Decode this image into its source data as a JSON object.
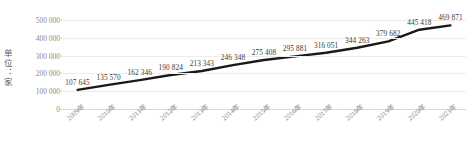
{
  "chart_data": {
    "type": "line",
    "title": "",
    "subtitle": "",
    "xlabel": "",
    "ylabel": "单位：家",
    "categories": [
      "2009年",
      "2010年",
      "2011年",
      "2012年",
      "2013年",
      "2014年",
      "2015年",
      "2016年",
      "2017年",
      "2018年",
      "2019年",
      "2020年",
      "2021年"
    ],
    "values": [
      107645,
      135570,
      162346,
      190824,
      213343,
      246348,
      275408,
      295881,
      316051,
      344263,
      379682,
      445418,
      469871
    ],
    "data_labels": [
      "107 645",
      "135 570",
      "162 346",
      "190 824",
      "213 343",
      "246 348",
      "275 408",
      "295 881",
      "316 051",
      "344 263",
      "379 682",
      "445 418",
      "469 871"
    ],
    "ytick_labels": [
      "0",
      "100 000",
      "200 000",
      "300 000",
      "400 000",
      "500 000"
    ],
    "ytick_values": [
      0,
      100000,
      200000,
      300000,
      400000,
      500000
    ],
    "ylim": [
      0,
      500000
    ],
    "grid": true,
    "legend": "none",
    "series_color": "#1a1a1a",
    "gridline_color": "#ececec",
    "tick_text_color": "#8a8a8a",
    "label_text_color": "#3c3c3c"
  }
}
